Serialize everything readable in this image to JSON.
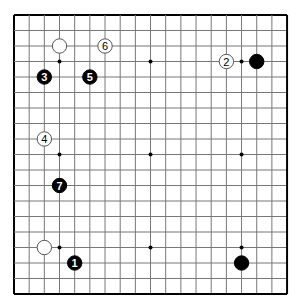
{
  "board": {
    "size": 19,
    "origin_x": 14,
    "origin_y": 15,
    "step_x": 15.17,
    "step_y": 15.5,
    "line_color": "#777777",
    "border_color": "#000000",
    "star_points": [
      [
        3,
        3
      ],
      [
        9,
        3
      ],
      [
        15,
        3
      ],
      [
        3,
        9
      ],
      [
        9,
        9
      ],
      [
        15,
        9
      ],
      [
        3,
        15
      ],
      [
        9,
        15
      ],
      [
        15,
        15
      ]
    ]
  },
  "stones": [
    {
      "color": "white",
      "col": 3,
      "row": 2,
      "label": ""
    },
    {
      "color": "white",
      "col": 6,
      "row": 2,
      "label": "6"
    },
    {
      "color": "black",
      "col": 2,
      "row": 4,
      "label": "3"
    },
    {
      "color": "black",
      "col": 5,
      "row": 4,
      "label": "5"
    },
    {
      "color": "white",
      "col": 14,
      "row": 3,
      "label": "2"
    },
    {
      "color": "black",
      "col": 16,
      "row": 3,
      "label": ""
    },
    {
      "color": "white",
      "col": 2,
      "row": 8,
      "label": "4"
    },
    {
      "color": "black",
      "col": 3,
      "row": 11,
      "label": "7"
    },
    {
      "color": "white",
      "col": 2,
      "row": 15,
      "label": ""
    },
    {
      "color": "black",
      "col": 4,
      "row": 16,
      "label": "1"
    },
    {
      "color": "black",
      "col": 15,
      "row": 16,
      "label": ""
    }
  ]
}
